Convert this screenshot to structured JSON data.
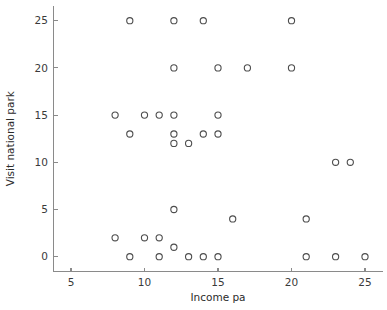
{
  "chart_data": {
    "type": "scatter",
    "title": "",
    "xlabel": "Income pa",
    "ylabel": "Visit national park",
    "xlim": [
      3.8,
      26.2
    ],
    "ylim": [
      -1.6,
      26.6
    ],
    "xticks": [
      5,
      10,
      15,
      20,
      25
    ],
    "xtick_labels": [
      "5",
      "10",
      "15",
      "20",
      "25"
    ],
    "yticks": [
      0,
      5,
      10,
      15,
      20,
      25
    ],
    "ytick_labels": [
      "0",
      "5",
      "10",
      "15",
      "20",
      "25"
    ],
    "grid": false,
    "legend": null,
    "marker": "open-circle",
    "marker_color": "#4d4d4d",
    "points": [
      {
        "x": 9,
        "y": 25
      },
      {
        "x": 12,
        "y": 25
      },
      {
        "x": 14,
        "y": 25
      },
      {
        "x": 20,
        "y": 25
      },
      {
        "x": 12,
        "y": 20
      },
      {
        "x": 15,
        "y": 20
      },
      {
        "x": 17,
        "y": 20
      },
      {
        "x": 20,
        "y": 20
      },
      {
        "x": 8,
        "y": 15
      },
      {
        "x": 10,
        "y": 15
      },
      {
        "x": 11,
        "y": 15
      },
      {
        "x": 12,
        "y": 15
      },
      {
        "x": 15,
        "y": 15
      },
      {
        "x": 9,
        "y": 13
      },
      {
        "x": 12,
        "y": 13
      },
      {
        "x": 14,
        "y": 13
      },
      {
        "x": 15,
        "y": 13
      },
      {
        "x": 12,
        "y": 12
      },
      {
        "x": 13,
        "y": 12
      },
      {
        "x": 23,
        "y": 10
      },
      {
        "x": 24,
        "y": 10
      },
      {
        "x": 12,
        "y": 5
      },
      {
        "x": 16,
        "y": 4
      },
      {
        "x": 21,
        "y": 4
      },
      {
        "x": 8,
        "y": 2
      },
      {
        "x": 10,
        "y": 2
      },
      {
        "x": 11,
        "y": 2
      },
      {
        "x": 12,
        "y": 1
      },
      {
        "x": 9,
        "y": 0
      },
      {
        "x": 11,
        "y": 0
      },
      {
        "x": 13,
        "y": 0
      },
      {
        "x": 14,
        "y": 0
      },
      {
        "x": 15,
        "y": 0
      },
      {
        "x": 21,
        "y": 0
      },
      {
        "x": 23,
        "y": 0
      },
      {
        "x": 25,
        "y": 0
      }
    ]
  }
}
